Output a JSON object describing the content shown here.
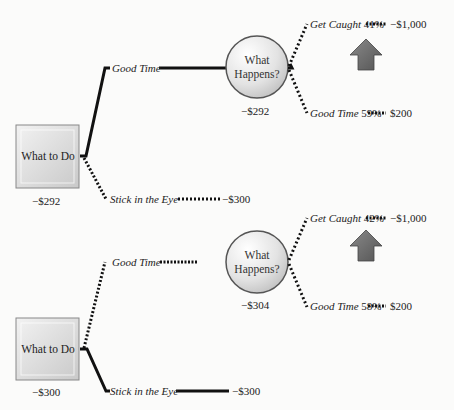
{
  "trees": [
    {
      "decision": {
        "label": "What to Do",
        "value": "−$292"
      },
      "branches": {
        "good_time": {
          "label": "Good Time",
          "style": "solid"
        },
        "stick_eye": {
          "label": "Stick in the Eye",
          "value": "−$300",
          "style": "dotted"
        }
      },
      "chance": {
        "label_line1": "What",
        "label_line2": "Happens?",
        "value": "−$292"
      },
      "outcomes": [
        {
          "label": "Get Caught",
          "percent": "41%",
          "value": "−$1,000"
        },
        {
          "label": "Good Time",
          "percent": "59%",
          "value": "$200"
        }
      ],
      "arrow": "up-arrow"
    },
    {
      "decision": {
        "label": "What to Do",
        "value": "−$300"
      },
      "branches": {
        "good_time": {
          "label": "Good Time",
          "style": "dotted"
        },
        "stick_eye": {
          "label": "Stick in the Eye",
          "value": "−$300",
          "style": "solid"
        }
      },
      "chance": {
        "label_line1": "What",
        "label_line2": "Happens?",
        "value": "−$304"
      },
      "outcomes": [
        {
          "label": "Get Caught",
          "percent": "42%",
          "value": "−$1,000"
        },
        {
          "label": "Good Time",
          "percent": "58%",
          "value": "$200"
        }
      ],
      "arrow": "up-arrow"
    }
  ],
  "colors": {
    "line": "#111111",
    "box": "#d9d9d9",
    "circle": "#dcdcdc",
    "arrow": "#6a6a6a",
    "background": "#fbfbfa"
  }
}
